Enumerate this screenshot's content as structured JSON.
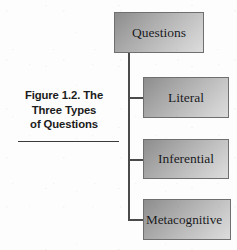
{
  "figure": {
    "caption_lines": [
      "Figure 1.2. The",
      "Three Types",
      "of Questions"
    ],
    "caption_full": "Figure 1.2. The Three Types of Questions"
  },
  "diagram": {
    "type": "tree",
    "orientation": "vertical-trunk-right-branches",
    "root": {
      "id": "questions",
      "label": "Questions"
    },
    "children": [
      {
        "id": "literal",
        "label": "Literal"
      },
      {
        "id": "inferential",
        "label": "Inferential"
      },
      {
        "id": "metacognitive",
        "label": "Metacognitive"
      }
    ]
  },
  "style": {
    "background": "#fdfdfd",
    "box_gradient_start": "#8d8d8d",
    "box_gradient_end": "#dcdcdc",
    "box_border": "#6f6f6f",
    "connector_color": "#4a4a4a",
    "caption_color": "#1b1b1b",
    "label_color": "#17171a"
  }
}
